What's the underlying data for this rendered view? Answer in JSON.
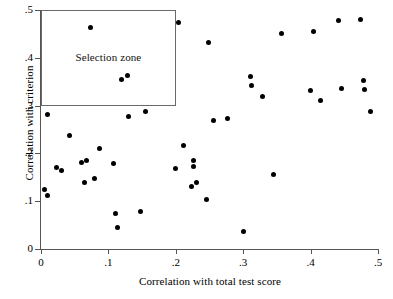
{
  "chart_data": {
    "type": "scatter",
    "title": "",
    "xlabel": "Correlation with total test score",
    "ylabel": "Correlation with criterion",
    "xlim": [
      0,
      0.5
    ],
    "ylim": [
      0,
      0.5
    ],
    "xticks": [
      "0",
      ".1",
      ".2",
      ".3",
      ".4",
      ".5"
    ],
    "xtick_values": [
      0,
      0.1,
      0.2,
      0.3,
      0.4,
      0.5
    ],
    "yticks": [
      "0",
      ".1",
      ".2",
      ".3",
      ".4",
      ".5"
    ],
    "ytick_values": [
      0,
      0.1,
      0.2,
      0.3,
      0.4,
      0.5
    ],
    "grid": false,
    "legend": null,
    "marker": "filled-circle",
    "marker_color": "#000000",
    "annotations": [
      {
        "name": "selection-zone",
        "label": "Selection zone",
        "shape": "rectangle",
        "x0": 0.0,
        "x1": 0.2,
        "y0": 0.3,
        "y1": 0.5,
        "border_color": "#6a6a6a"
      }
    ],
    "points": [
      {
        "x": 0.01,
        "y": 0.281
      },
      {
        "x": 0.005,
        "y": 0.124
      },
      {
        "x": 0.009,
        "y": 0.111
      },
      {
        "x": 0.023,
        "y": 0.171
      },
      {
        "x": 0.031,
        "y": 0.164
      },
      {
        "x": 0.042,
        "y": 0.237
      },
      {
        "x": 0.06,
        "y": 0.181
      },
      {
        "x": 0.067,
        "y": 0.185
      },
      {
        "x": 0.064,
        "y": 0.139
      },
      {
        "x": 0.074,
        "y": 0.464
      },
      {
        "x": 0.08,
        "y": 0.148
      },
      {
        "x": 0.087,
        "y": 0.211
      },
      {
        "x": 0.108,
        "y": 0.179
      },
      {
        "x": 0.111,
        "y": 0.075
      },
      {
        "x": 0.114,
        "y": 0.045
      },
      {
        "x": 0.12,
        "y": 0.355
      },
      {
        "x": 0.128,
        "y": 0.364
      },
      {
        "x": 0.13,
        "y": 0.277
      },
      {
        "x": 0.148,
        "y": 0.078
      },
      {
        "x": 0.155,
        "y": 0.287
      },
      {
        "x": 0.199,
        "y": 0.168
      },
      {
        "x": 0.204,
        "y": 0.473
      },
      {
        "x": 0.211,
        "y": 0.217
      },
      {
        "x": 0.226,
        "y": 0.185
      },
      {
        "x": 0.227,
        "y": 0.172
      },
      {
        "x": 0.223,
        "y": 0.131
      },
      {
        "x": 0.23,
        "y": 0.139
      },
      {
        "x": 0.245,
        "y": 0.103
      },
      {
        "x": 0.249,
        "y": 0.431
      },
      {
        "x": 0.256,
        "y": 0.268
      },
      {
        "x": 0.277,
        "y": 0.272
      },
      {
        "x": 0.3,
        "y": 0.037
      },
      {
        "x": 0.311,
        "y": 0.361
      },
      {
        "x": 0.313,
        "y": 0.343
      },
      {
        "x": 0.329,
        "y": 0.32
      },
      {
        "x": 0.345,
        "y": 0.156
      },
      {
        "x": 0.357,
        "y": 0.451
      },
      {
        "x": 0.4,
        "y": 0.332
      },
      {
        "x": 0.405,
        "y": 0.455
      },
      {
        "x": 0.414,
        "y": 0.31
      },
      {
        "x": 0.441,
        "y": 0.479
      },
      {
        "x": 0.446,
        "y": 0.336
      },
      {
        "x": 0.474,
        "y": 0.481
      },
      {
        "x": 0.479,
        "y": 0.353
      },
      {
        "x": 0.48,
        "y": 0.334
      },
      {
        "x": 0.489,
        "y": 0.287
      }
    ]
  }
}
